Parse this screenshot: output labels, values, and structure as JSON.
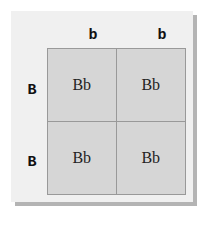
{
  "punnett": {
    "columns": [
      "b",
      "b"
    ],
    "rows": [
      "B",
      "B"
    ],
    "cells": [
      [
        "Bb",
        "Bb"
      ],
      [
        "Bb",
        "Bb"
      ]
    ]
  },
  "colors": {
    "card": "#f0f0f0",
    "cell": "#d6d6d6",
    "border": "#999999",
    "shadow": "#b4b4b4"
  }
}
